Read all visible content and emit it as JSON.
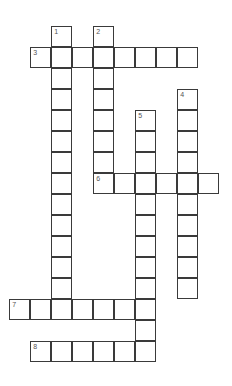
{
  "puzzle": {
    "type": "crossword",
    "cell_size": 21,
    "origin": {
      "x": 10,
      "y": 27
    },
    "entries": [
      {
        "number": "1",
        "direction": "down",
        "col": 2,
        "row": 0,
        "length": 14
      },
      {
        "number": "2",
        "direction": "down",
        "col": 4,
        "row": 0,
        "length": 8
      },
      {
        "number": "3",
        "direction": "across",
        "col": 1,
        "row": 1,
        "length": 8
      },
      {
        "number": "4",
        "direction": "down",
        "col": 8,
        "row": 3,
        "length": 10
      },
      {
        "number": "5",
        "direction": "down",
        "col": 6,
        "row": 4,
        "length": 12
      },
      {
        "number": "6",
        "direction": "across",
        "col": 4,
        "row": 7,
        "length": 6
      },
      {
        "number": "7",
        "direction": "across",
        "col": 0,
        "row": 13,
        "length": 7
      },
      {
        "number": "8",
        "direction": "across",
        "col": 1,
        "row": 15,
        "length": 6
      }
    ]
  }
}
